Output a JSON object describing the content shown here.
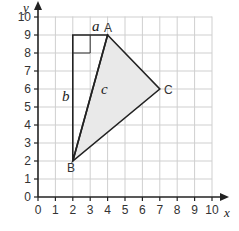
{
  "chart_data": {
    "type": "diagram",
    "title": "",
    "xlabel": "x",
    "ylabel": "y",
    "xlim": [
      0,
      10
    ],
    "ylim": [
      0,
      10
    ],
    "grid": true,
    "x_ticks": [
      "0",
      "1",
      "2",
      "3",
      "4",
      "5",
      "6",
      "7",
      "8",
      "9",
      "10"
    ],
    "y_ticks": [
      "0",
      "1",
      "2",
      "3",
      "4",
      "5",
      "6",
      "7",
      "8",
      "9",
      "10"
    ],
    "points": [
      {
        "name": "A",
        "x": 4,
        "y": 9
      },
      {
        "name": "B",
        "x": 2,
        "y": 2
      },
      {
        "name": "C",
        "x": 7,
        "y": 6
      }
    ],
    "triangle": [
      "A",
      "B",
      "C"
    ],
    "right_triangle": {
      "vertices": [
        [
          2,
          9
        ],
        [
          4,
          9
        ],
        [
          2,
          2
        ]
      ],
      "right_angle_at": [
        2,
        9
      ],
      "sides": {
        "a": "horizontal (2,9)-(4,9)",
        "b": "vertical (2,9)-(2,2)",
        "c": "hypotenuse A-B"
      }
    },
    "side_labels": [
      "a",
      "b",
      "c"
    ]
  },
  "labels": {
    "x_axis": "x",
    "y_axis": "y",
    "point_a": "A",
    "point_b": "B",
    "point_c": "C",
    "side_a": "a",
    "side_b": "b",
    "side_c": "c"
  }
}
